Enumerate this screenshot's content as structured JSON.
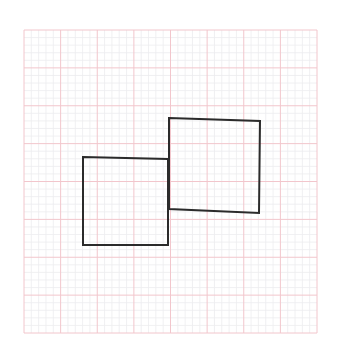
{
  "canvas": {
    "width": 337,
    "height": 360,
    "background": "#ffffff"
  },
  "grid": {
    "x0": 24,
    "y0": 30,
    "x1": 317,
    "y1": 333,
    "major_count_x": 8,
    "major_count_y": 8,
    "minor_per_major": 5,
    "major_color": "#f2c6cc",
    "minor_color": "#ececef",
    "border_color": "#f0d0d4"
  },
  "shapes": [
    {
      "name": "left-square",
      "stroke": "#2b2b2b",
      "points": [
        [
          83,
          157
        ],
        [
          168,
          159
        ],
        [
          168,
          245
        ],
        [
          83,
          245
        ]
      ]
    },
    {
      "name": "right-square",
      "stroke": "#2b2b2b",
      "points": [
        [
          169,
          118
        ],
        [
          260,
          121
        ],
        [
          259,
          213
        ],
        [
          169,
          209
        ]
      ]
    }
  ]
}
